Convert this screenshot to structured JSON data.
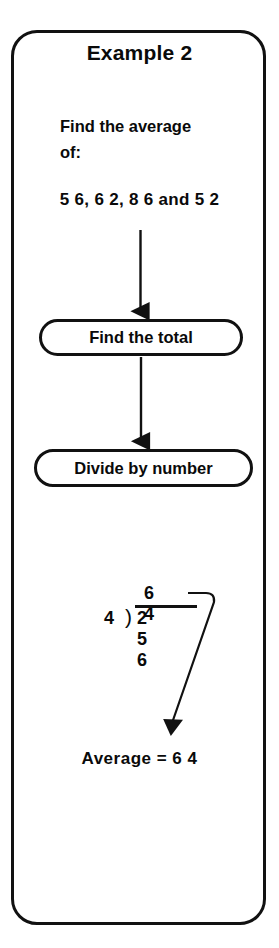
{
  "page": {
    "title": "Example 2",
    "background_color": "#ffffff",
    "ink_color": "#111111"
  },
  "prompt": {
    "line1": "Find the average",
    "line2": "of:"
  },
  "numbers_line": "5 6, 6 2, 8 6 and 5 2",
  "flow_steps": [
    {
      "label": "Find the total"
    },
    {
      "label": "Divide by number"
    }
  ],
  "division": {
    "quotient": "6 4",
    "divisor": "4",
    "bracket": ")",
    "dividend": "2 5 6"
  },
  "answer": "Average = 6 4",
  "source_values": {
    "numbers": [
      56,
      62,
      86,
      52
    ],
    "total": 256,
    "count": 4,
    "average": 64
  }
}
